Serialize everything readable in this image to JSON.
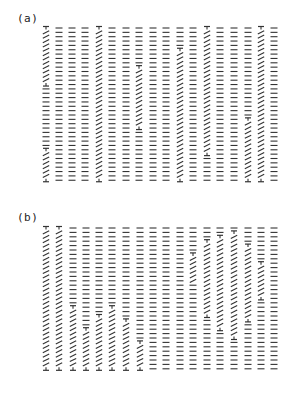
{
  "figure": {
    "ink_color": "#333333",
    "panels": [
      {
        "label": "(a)",
        "label_pos": [
          17,
          20
        ],
        "top": 28,
        "rows": 36,
        "row_spacing": 4.35,
        "columns": [
          46,
          59,
          72,
          85,
          99,
          112,
          126,
          139,
          153,
          166,
          180,
          193,
          207,
          220,
          234,
          248,
          261,
          274
        ],
        "twist_segments": [
          {
            "col": 0,
            "from": 28,
            "to": 85
          },
          {
            "col": 0,
            "from": 150,
            "to": 182
          },
          {
            "col": 4,
            "from": 28,
            "to": 182
          },
          {
            "col": 7,
            "from": 67,
            "to": 130
          },
          {
            "col": 10,
            "from": 48,
            "to": 182
          },
          {
            "col": 12,
            "from": 28,
            "to": 155
          },
          {
            "col": 15,
            "from": 117,
            "to": 182
          },
          {
            "col": 16,
            "from": 28,
            "to": 182
          }
        ]
      },
      {
        "label": "(b)",
        "label_pos": [
          17,
          219
        ],
        "top": 228,
        "rows": 33,
        "row_spacing": 4.4,
        "columns": [
          46,
          59,
          73,
          86,
          99,
          112,
          126,
          140,
          153,
          166,
          180,
          193,
          207,
          220,
          234,
          248,
          261,
          274
        ],
        "twist_segments": [
          {
            "col": 0,
            "from": 228,
            "to": 368
          },
          {
            "col": 1,
            "from": 228,
            "to": 368
          },
          {
            "col": 2,
            "from": 305,
            "to": 368
          },
          {
            "col": 3,
            "from": 330,
            "to": 368
          },
          {
            "col": 4,
            "from": 315,
            "to": 368
          },
          {
            "col": 5,
            "from": 305,
            "to": 368
          },
          {
            "col": 6,
            "from": 320,
            "to": 368
          },
          {
            "col": 7,
            "from": 340,
            "to": 368
          },
          {
            "col": 11,
            "from": 255,
            "to": 284
          },
          {
            "col": 12,
            "from": 241,
            "to": 318
          },
          {
            "col": 13,
            "from": 236,
            "to": 330
          },
          {
            "col": 14,
            "from": 232,
            "to": 338
          },
          {
            "col": 15,
            "from": 245,
            "to": 322
          },
          {
            "col": 16,
            "from": 262,
            "to": 300
          }
        ]
      }
    ]
  }
}
